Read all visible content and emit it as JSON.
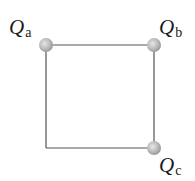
{
  "diagram": {
    "type": "square-charge-configuration",
    "line_color": "#555555",
    "charge_color": "#b8b8b8",
    "charges": [
      {
        "id": "a",
        "symbol": "Q",
        "subscript": "a",
        "position": "top-left"
      },
      {
        "id": "b",
        "symbol": "Q",
        "subscript": "b",
        "position": "top-right"
      },
      {
        "id": "c",
        "symbol": "Q",
        "subscript": "c",
        "position": "bottom-right"
      }
    ],
    "empty_corner": "bottom-left"
  }
}
